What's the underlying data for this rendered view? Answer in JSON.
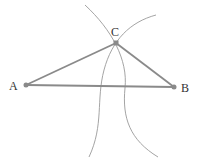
{
  "diagram": {
    "points": [
      {
        "label": "A",
        "x": 26,
        "y": 85
      },
      {
        "label": "B",
        "x": 174,
        "y": 87
      },
      {
        "label": "C",
        "x": 116,
        "y": 43
      }
    ],
    "segments": [
      [
        "A",
        "B"
      ],
      [
        "A",
        "C"
      ],
      [
        "C",
        "B"
      ]
    ],
    "colors": {
      "segment": "#8a8a8a",
      "arc": "#9a9a9a",
      "point": "#8a8a8a",
      "label": "#333333"
    }
  }
}
